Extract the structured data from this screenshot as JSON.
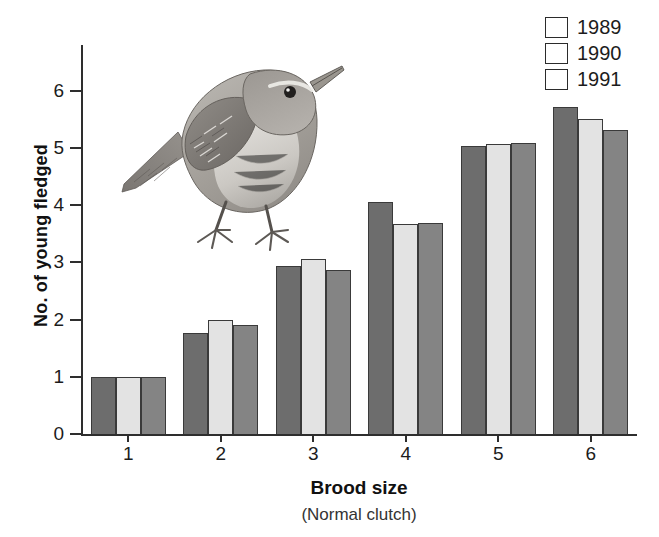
{
  "chart_data": {
    "type": "bar",
    "title": "",
    "xlabel": "Brood size",
    "xsublabel": "(Normal clutch)",
    "ylabel": "No. of young fledged",
    "categories": [
      "1",
      "2",
      "3",
      "4",
      "5",
      "6"
    ],
    "ylim": [
      0,
      6.8
    ],
    "yticks": [
      0,
      1,
      2,
      3,
      4,
      5,
      6
    ],
    "yticklabels": [
      "0",
      "1",
      "2",
      "3",
      "4",
      "5",
      "6"
    ],
    "grid": false,
    "legend_position": "top-right",
    "series": [
      {
        "name": "1989",
        "color": "#6d6d6d",
        "values": [
          1.0,
          1.77,
          2.94,
          4.06,
          5.03,
          5.72
        ]
      },
      {
        "name": "1990",
        "color": "#e3e3e3",
        "values": [
          1.0,
          1.99,
          3.06,
          3.67,
          5.07,
          5.51
        ]
      },
      {
        "name": "1991",
        "color": "#848484",
        "values": [
          1.0,
          1.91,
          2.86,
          3.68,
          5.09,
          5.32
        ]
      }
    ],
    "annotations": [
      "wren illustration"
    ]
  },
  "legend": {
    "items": [
      {
        "label": "1989",
        "swatch": "legend-swatch-1989"
      },
      {
        "label": "1990",
        "swatch": "legend-swatch-1990"
      },
      {
        "label": "1991",
        "swatch": "legend-swatch-1991"
      }
    ]
  },
  "illustration": {
    "name": "wren-bird-illustration",
    "description": "Wren"
  }
}
